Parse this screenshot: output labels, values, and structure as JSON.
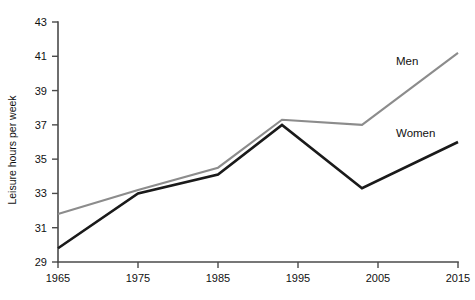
{
  "chart_data": {
    "type": "line",
    "title": "",
    "xlabel": "",
    "ylabel": "Leisure hours per week",
    "xlim": [
      1965,
      2015
    ],
    "ylim": [
      29,
      43
    ],
    "xticks": [
      1965,
      1975,
      1985,
      1995,
      2005,
      2015
    ],
    "xtick_labels": [
      "1965",
      "1975",
      "1985",
      "1995",
      "2005",
      "2015"
    ],
    "yticks": [
      29,
      31,
      33,
      35,
      37,
      39,
      41,
      43
    ],
    "ytick_labels": [
      "29",
      "31",
      "33",
      "35",
      "37",
      "39",
      "41",
      "43"
    ],
    "grid": false,
    "legend_position": "inline-right",
    "series": [
      {
        "name": "Men",
        "color": "#8c8c8c",
        "label_text": "Men",
        "x": [
          1965,
          1975,
          1985,
          1993,
          2003,
          2015
        ],
        "values": [
          31.8,
          33.2,
          34.5,
          37.3,
          37.0,
          41.2
        ]
      },
      {
        "name": "Women",
        "color": "#1a1a1a",
        "label_text": "Women",
        "x": [
          1965,
          1975,
          1985,
          1993,
          2003,
          2015
        ],
        "values": [
          29.8,
          33.0,
          34.1,
          37.0,
          33.3,
          36.0
        ]
      }
    ]
  },
  "labels": {
    "y_axis_title": "Leisure hours per week",
    "men": "Men",
    "women": "Women"
  }
}
